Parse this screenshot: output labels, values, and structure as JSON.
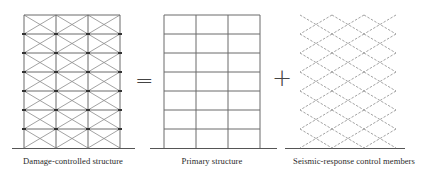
{
  "diagram": {
    "equation": {
      "equals_symbol": "=",
      "plus_symbol": "+"
    },
    "panels": [
      {
        "id": "damage-controlled",
        "label": "Damage-controlled structure",
        "stories": 7,
        "bays": 3,
        "frame": "solid",
        "bracing": "solid-light",
        "joints": true
      },
      {
        "id": "primary",
        "label": "Primary structure",
        "stories": 7,
        "bays": 3,
        "frame": "solid",
        "bracing": "none",
        "joints": false
      },
      {
        "id": "seismic-control",
        "label": "Seismic-response control members",
        "stories": 7,
        "bays": 3,
        "frame": "none",
        "bracing": "dashed",
        "joints": false
      }
    ],
    "colors": {
      "frame": "#6a6a6a",
      "bracing": "#8a8a8a",
      "joint": "#333333",
      "ground": "#555555",
      "text": "#2a2a2a"
    }
  }
}
